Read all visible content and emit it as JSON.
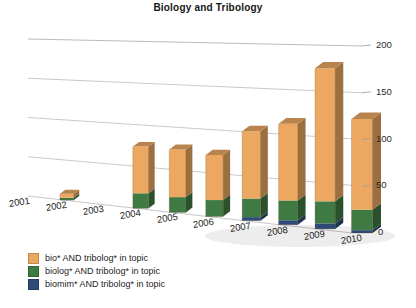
{
  "chart_data": {
    "type": "bar",
    "title": "Biology and Tribology",
    "subtitle": "",
    "xlabel": "",
    "ylabel": "",
    "ylim": [
      0,
      200
    ],
    "yticks": [
      0,
      50,
      100,
      150,
      200
    ],
    "ytick_labels": [
      "0",
      "50",
      "100",
      "150",
      "200"
    ],
    "grid": true,
    "legend_position": "bottom-left",
    "stacked": true,
    "three_d": true,
    "categories": [
      "2001",
      "2002",
      "2003",
      "2004",
      "2005",
      "2006",
      "2007",
      "2008",
      "2009",
      "2010"
    ],
    "series": [
      {
        "name": "bio* AND tribolog* in topic",
        "color": "#eca861",
        "values": [
          0,
          5,
          0,
          56,
          56,
          52,
          76,
          85,
          145,
          97
        ]
      },
      {
        "name": "biolog* AND tribolog* in topic",
        "color": "#3f7a42",
        "values": [
          0,
          3,
          0,
          18,
          18,
          19,
          21,
          22,
          24,
          22
        ]
      },
      {
        "name": "biomim* AND tribolog* in topic",
        "color": "#2e4a77",
        "values": [
          0,
          0,
          0,
          0,
          0,
          0,
          4,
          5,
          6,
          3
        ]
      }
    ],
    "totals": [
      0,
      8,
      0,
      74,
      74,
      71,
      101,
      112,
      175,
      122
    ]
  },
  "legend": {
    "items": [
      {
        "label": "bio* AND tribolog* in topic",
        "color": "#eca861"
      },
      {
        "label": "biolog* AND tribolog* in topic",
        "color": "#3f7a42"
      },
      {
        "label": "biomim* AND tribolog* in topic",
        "color": "#2e4a77"
      }
    ]
  },
  "colors": {
    "orange_face": "#eca861",
    "orange_side": "#b9763a",
    "orange_top": "#d89a58",
    "green_face": "#3f7a42",
    "green_side": "#2d5a30",
    "blue_face": "#2e4a77",
    "blue_side": "#22375a",
    "gridline": "#9a9a9a",
    "background": "#ffffff",
    "text": "#1a1a1a"
  }
}
